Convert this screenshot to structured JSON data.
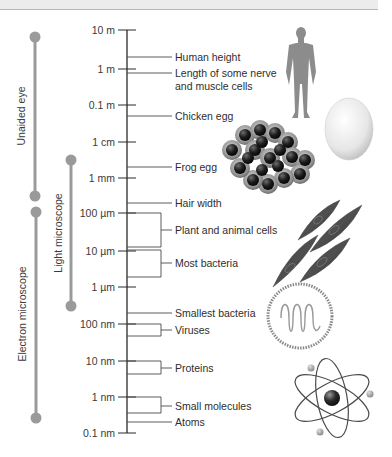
{
  "diagram": {
    "type": "log-scale size comparison",
    "scale_ticks": [
      {
        "label": "10 m",
        "y": 30
      },
      {
        "label": "1 m",
        "y": 69
      },
      {
        "label": "0.1 m",
        "y": 105
      },
      {
        "label": "1 cm",
        "y": 142
      },
      {
        "label": "1 mm",
        "y": 178
      },
      {
        "label": "100 µm",
        "y": 213
      },
      {
        "label": "10 µm",
        "y": 251
      },
      {
        "label": "1 µm",
        "y": 287
      },
      {
        "label": "100 nm",
        "y": 324
      },
      {
        "label": "10 nm",
        "y": 361
      },
      {
        "label": "1 nm",
        "y": 397
      },
      {
        "label": "0.1 nm",
        "y": 432
      }
    ],
    "items": [
      {
        "label": "Human height",
        "label2": "",
        "y": 57,
        "type": "line"
      },
      {
        "label": "Length of some nerve",
        "label2": "and muscle cells",
        "y": 73,
        "type": "line"
      },
      {
        "label": "Chicken egg",
        "label2": "",
        "y": 116,
        "type": "line"
      },
      {
        "label": "Frog egg",
        "label2": "",
        "y": 167,
        "type": "line"
      },
      {
        "label": "Hair width",
        "label2": "",
        "y": 203,
        "type": "line"
      },
      {
        "label": "Plant and animal cells",
        "label2": "",
        "y": 230,
        "type": "bracket",
        "y1": 213,
        "y2": 247
      },
      {
        "label": "Most bacteria",
        "label2": "",
        "y": 263,
        "type": "bracket",
        "y1": 250,
        "y2": 277
      },
      {
        "label": "Smallest bacteria",
        "label2": "",
        "y": 313,
        "type": "line"
      },
      {
        "label": "Viruses",
        "label2": "",
        "y": 330,
        "type": "bracket",
        "y1": 324,
        "y2": 336
      },
      {
        "label": "Proteins",
        "label2": "",
        "y": 368,
        "type": "bracket",
        "y1": 361,
        "y2": 374
      },
      {
        "label": "Small molecules",
        "label2": "",
        "y": 406,
        "type": "bracket",
        "y1": 397,
        "y2": 413
      },
      {
        "label": "Atoms",
        "label2": "",
        "y": 422,
        "type": "line"
      }
    ],
    "ranges": [
      {
        "label": "Unaided eye",
        "x": 35,
        "y1": 37,
        "y2": 196
      },
      {
        "label": "Light microscope",
        "x": 70,
        "y1": 160,
        "y2": 306
      },
      {
        "label": "Electron microscope",
        "x": 36,
        "y1": 212,
        "y2": 418
      }
    ],
    "illustrations": [
      "human-silhouette",
      "chicken-egg",
      "frog-egg-cluster",
      "plant-animal-cells",
      "bacterium",
      "atom"
    ],
    "colors": {
      "range_bar": "#9a9a9a",
      "axis": "#2a2a2a",
      "text": "#333333",
      "top_band": "#ececec"
    }
  }
}
